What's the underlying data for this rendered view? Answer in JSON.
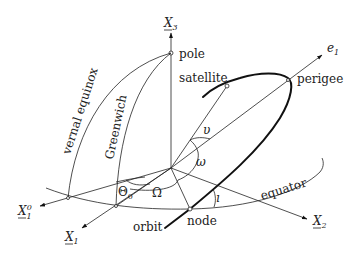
{
  "figure": {
    "type": "orbital-elements-diagram",
    "axes": {
      "x3": {
        "base": "X",
        "sub": "3"
      },
      "x1": {
        "base": "X",
        "sub": "1"
      },
      "x1_0": {
        "base": "X",
        "sub": "1",
        "sup": "0"
      },
      "x2": {
        "base": "X",
        "sub": "2"
      },
      "e1": {
        "base": "e",
        "sub": "1"
      }
    },
    "labels": {
      "pole": "pole",
      "satellite": "satellite",
      "perigee": "perigee",
      "vernal_equinox": "vernal equinox",
      "greenwich": "Greenwich",
      "equator": "equator",
      "orbit": "orbit",
      "node": "node"
    },
    "angles": {
      "theta0": {
        "base": "Θ",
        "sub": "0"
      },
      "Omega": "Ω",
      "omega": "ω",
      "nu": "υ",
      "inclination": "ı"
    }
  }
}
